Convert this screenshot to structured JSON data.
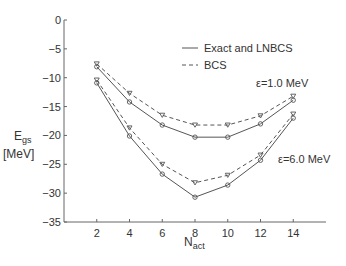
{
  "chart_data": {
    "type": "line",
    "title": "",
    "xlabel": "N_act",
    "ylabel": "E_gs [MeV]",
    "x": [
      2,
      4,
      6,
      8,
      10,
      12,
      14
    ],
    "xticks": [
      "2",
      "4",
      "6",
      "8",
      "10",
      "12",
      "14"
    ],
    "yticks": [
      "0",
      "-5",
      "-10",
      "-15",
      "-20",
      "-25",
      "-30",
      "-35"
    ],
    "xlim": [
      0,
      16
    ],
    "ylim": [
      -35,
      0
    ],
    "grid": false,
    "legend": {
      "position": "upper right",
      "entries": [
        {
          "label": "Exact and LNBCS",
          "style": "solid"
        },
        {
          "label": "BCS",
          "style": "dashed"
        }
      ]
    },
    "annotations": [
      "ε=1.0 MeV",
      "ε=6.0 MeV"
    ],
    "series": [
      {
        "name": "Exact and LNBCS (ε=1.0 MeV)",
        "style": "solid",
        "marker": "circle",
        "values": [
          -8.1,
          -14.2,
          -18.2,
          -20.3,
          -20.3,
          -18.0,
          -13.9
        ]
      },
      {
        "name": "BCS (ε=1.0 MeV)",
        "style": "dashed",
        "marker": "triangle-down",
        "values": [
          -7.6,
          -12.7,
          -16.5,
          -18.2,
          -18.2,
          -16.6,
          -13.2
        ]
      },
      {
        "name": "Exact and LNBCS (ε=6.0 MeV)",
        "style": "solid",
        "marker": "circle",
        "values": [
          -10.9,
          -20.1,
          -26.7,
          -30.7,
          -28.6,
          -24.3,
          -17.0
        ]
      },
      {
        "name": "BCS (ε=6.0 MeV)",
        "style": "dashed",
        "marker": "triangle-down",
        "values": [
          -10.4,
          -18.7,
          -25.0,
          -28.2,
          -26.9,
          -23.4,
          -16.3
        ]
      }
    ]
  },
  "labels": {
    "ylabel_main": "E",
    "ylabel_sub": "gs",
    "ylabel_unit": "[MeV]",
    "xlabel_main": "N",
    "xlabel_sub": "act",
    "legend_solid": "Exact and LNBCS",
    "legend_dashed": "BCS",
    "annot_upper": "ε=1.0 MeV",
    "annot_lower": "ε=6.0 MeV"
  }
}
